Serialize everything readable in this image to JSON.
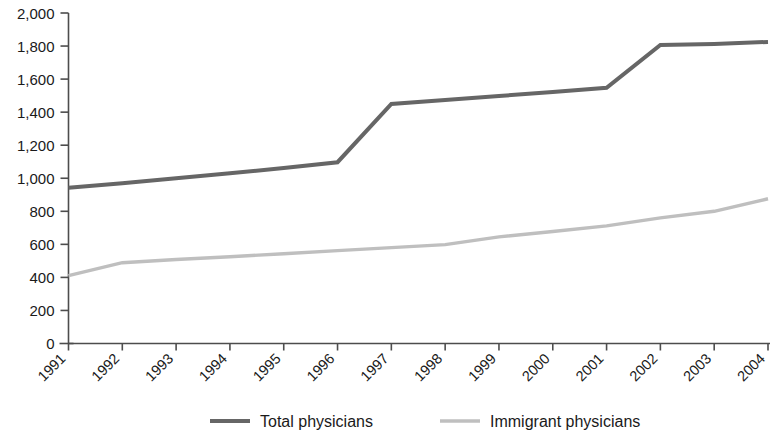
{
  "chart_data": {
    "type": "line",
    "title": "",
    "subtitle": "",
    "xlabel": "",
    "ylabel": "",
    "grid": false,
    "legend_position": "bottom",
    "ylim": [
      0,
      2000
    ],
    "ytick_values": [
      0,
      200,
      400,
      600,
      800,
      1000,
      1200,
      1400,
      1600,
      1800,
      2000
    ],
    "ytick_labels": [
      "0",
      "200",
      "400",
      "600",
      "800",
      "1,000",
      "1,200",
      "1,400",
      "1,600",
      "1,800",
      "2,000"
    ],
    "categories": [
      "1991",
      "1992",
      "1993",
      "1994",
      "1995",
      "1996",
      "1997",
      "1998",
      "1999",
      "2000",
      "2001",
      "2002",
      "2003",
      "2004"
    ],
    "x": [
      1991,
      1992,
      1993,
      1994,
      1995,
      1996,
      1997,
      1998,
      1999,
      2000,
      2001,
      2002,
      2003,
      2004
    ],
    "series": [
      {
        "name": "Total physicians",
        "color": "#666666",
        "width": 4.0,
        "values": [
          942,
          970,
          1000,
          1030,
          1062,
          1097,
          1450,
          1474,
          1498,
          1522,
          1547,
          1807,
          1813,
          1825
        ]
      },
      {
        "name": "Immigrant physicians",
        "color": "#bfbfbf",
        "width": 3.4,
        "values": [
          411,
          489,
          508,
          525,
          543,
          562,
          580,
          598,
          645,
          678,
          712,
          760,
          800,
          876
        ]
      }
    ]
  },
  "legend": {
    "entries": [
      {
        "label": "Total physicians",
        "color": "#666666"
      },
      {
        "label": "Immigrant physicians",
        "color": "#bfbfbf"
      }
    ]
  },
  "axes": {
    "y_axis_name": "y-axis",
    "x_axis_name": "x-axis"
  }
}
